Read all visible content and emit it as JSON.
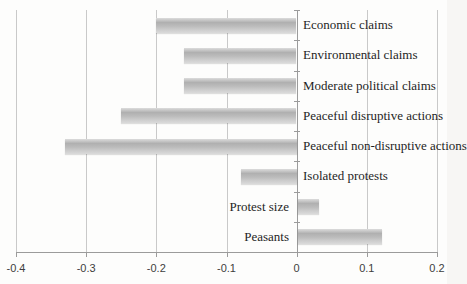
{
  "chart_data": {
    "type": "bar",
    "orientation": "horizontal",
    "title": "",
    "xlabel": "",
    "ylabel": "",
    "categories": [
      "Economic claims",
      "Environmental claims",
      "Moderate political claims",
      "Peaceful disruptive actions",
      "Peaceful non-disruptive actions",
      "Isolated protests",
      "Protest size",
      "Peasants"
    ],
    "values": [
      -0.2,
      -0.16,
      -0.16,
      -0.25,
      -0.33,
      -0.08,
      0.03,
      0.12
    ],
    "xlim": [
      -0.4,
      0.2
    ],
    "xticks": [
      -0.4,
      -0.3,
      -0.2,
      -0.1,
      0,
      0.1,
      0.2
    ],
    "xtick_labels": [
      "-0.4",
      "-0.3",
      "-0.2",
      "-0.1",
      "0",
      "0.1",
      "0.2"
    ],
    "grid": true,
    "legend": "none",
    "colors": {
      "bar_mid": "#bcbcbc",
      "bar_light": "#dcdcdc",
      "gridline": "#c9c9c9",
      "axis": "#9b9b9b",
      "category_text": "#1f1f1f",
      "tick_text": "#3d3d3d",
      "background": "#fdfdfc"
    }
  }
}
